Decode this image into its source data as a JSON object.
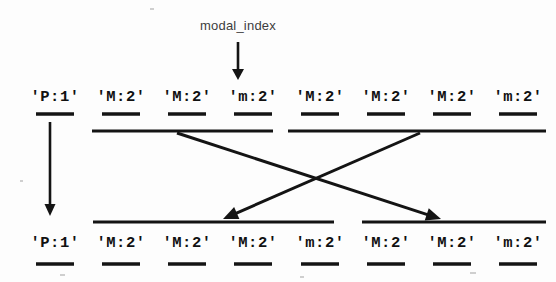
{
  "figure": {
    "title_annotation": "modal_index",
    "background_color": "#fdfdfd",
    "ink_color": "#141414",
    "caption_color": "#3d3d3d"
  },
  "pointer": {
    "label": "modal_index",
    "label_x": 238,
    "label_y": 30,
    "arrow_from_x": 238,
    "arrow_from_y": 42,
    "arrow_to_x": 238,
    "arrow_to_y": 80
  },
  "top_row": {
    "name": "input-sequence",
    "y_label": 101,
    "y_dash": 114,
    "tokens": [
      {
        "text": "'P:1'",
        "x": 55
      },
      {
        "text": "'M:2'",
        "x": 121
      },
      {
        "text": "'M:2'",
        "x": 187
      },
      {
        "text": "'m:2'",
        "x": 253
      },
      {
        "text": "'M:2'",
        "x": 320
      },
      {
        "text": "'M:2'",
        "x": 386
      },
      {
        "text": "'M:2'",
        "x": 452
      },
      {
        "text": "'m:2'",
        "x": 518
      }
    ]
  },
  "bottom_row": {
    "name": "output-sequence",
    "y_label": 247,
    "y_dash": 264,
    "tokens": [
      {
        "text": "'P:1'",
        "x": 55
      },
      {
        "text": "'M:2'",
        "x": 121
      },
      {
        "text": "'M:2'",
        "x": 187
      },
      {
        "text": "'M:2'",
        "x": 253
      },
      {
        "text": "'m:2'",
        "x": 320
      },
      {
        "text": "'M:2'",
        "x": 386
      },
      {
        "text": "'M:2'",
        "x": 452
      },
      {
        "text": "'m:2'",
        "x": 518
      }
    ]
  },
  "top_group_bars": [
    {
      "name": "top-group-bar-left",
      "x1": 92,
      "x2": 273,
      "y": 131
    },
    {
      "name": "top-group-bar-right",
      "x1": 288,
      "x2": 546,
      "y": 131
    }
  ],
  "bottom_group_bars": [
    {
      "name": "bottom-group-bar-left",
      "x1": 93,
      "x2": 334,
      "y": 222
    },
    {
      "name": "bottom-group-bar-right",
      "x1": 362,
      "x2": 546,
      "y": 222
    }
  ],
  "connectors": [
    {
      "name": "connector-left-to-right",
      "from_x": 177,
      "from_y": 133,
      "to_x": 441,
      "to_y": 219
    },
    {
      "name": "connector-right-to-left",
      "from_x": 420,
      "from_y": 133,
      "to_x": 223,
      "to_y": 219
    }
  ],
  "side_arrow": {
    "name": "carry-down-arrow",
    "from_x": 50,
    "from_y": 122,
    "to_x": 50,
    "to_y": 216
  }
}
